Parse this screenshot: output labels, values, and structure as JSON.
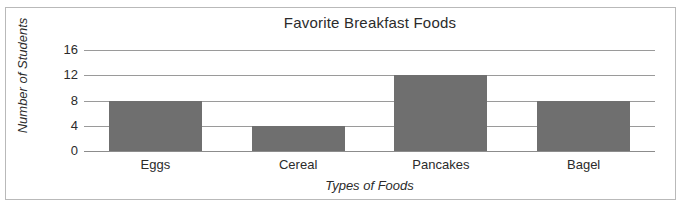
{
  "chart_data": {
    "type": "bar",
    "title": "Favorite Breakfast Foods",
    "xlabel": "Types of Foods",
    "ylabel": "Number of Students",
    "categories": [
      "Eggs",
      "Cereal",
      "Pancakes",
      "Bagel"
    ],
    "values": [
      8,
      4,
      12,
      8
    ],
    "yticks": [
      0,
      4,
      8,
      12,
      16
    ],
    "ylim": [
      0,
      16
    ],
    "grid": true,
    "legend": false,
    "bar_color": "#6f6f6f",
    "gridline_color": "#9a9a9a",
    "text_color": "#2b2b2b",
    "frame_color": "#b9b9b9"
  }
}
